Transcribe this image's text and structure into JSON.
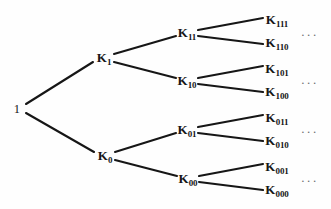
{
  "figure": {
    "name": "binary-branching-tree-diagram",
    "background_color": "#fefefe",
    "edge_color": "#161616",
    "label_color": "#161616",
    "ellipsis_color": "#6f6f6f",
    "width": 331,
    "height": 209
  },
  "nodes": [
    {
      "id": "root",
      "base": "1",
      "sub": "",
      "x": 17,
      "y": 108,
      "level": 0
    },
    {
      "id": "k1",
      "base": "K",
      "sub": "1",
      "x": 104,
      "y": 58,
      "level": 1
    },
    {
      "id": "k0",
      "base": "K",
      "sub": "0",
      "x": 105,
      "y": 156,
      "level": 1
    },
    {
      "id": "k11",
      "base": "K",
      "sub": "11",
      "x": 187,
      "y": 33,
      "level": 2
    },
    {
      "id": "k10",
      "base": "K",
      "sub": "10",
      "x": 187,
      "y": 81,
      "level": 2
    },
    {
      "id": "k01",
      "base": "K",
      "sub": "01",
      "x": 187,
      "y": 130,
      "level": 2
    },
    {
      "id": "k00",
      "base": "K",
      "sub": "00",
      "x": 188,
      "y": 179,
      "level": 2
    },
    {
      "id": "k111",
      "base": "K",
      "sub": "111",
      "x": 277,
      "y": 20,
      "level": 3
    },
    {
      "id": "k110",
      "base": "K",
      "sub": "110",
      "x": 277,
      "y": 43,
      "level": 3
    },
    {
      "id": "k101",
      "base": "K",
      "sub": "101",
      "x": 277,
      "y": 69,
      "level": 3
    },
    {
      "id": "k100",
      "base": "K",
      "sub": "100",
      "x": 277,
      "y": 92,
      "level": 3
    },
    {
      "id": "k011",
      "base": "K",
      "sub": "011",
      "x": 277,
      "y": 118,
      "level": 3
    },
    {
      "id": "k010",
      "base": "K",
      "sub": "010",
      "x": 277,
      "y": 141,
      "level": 3
    },
    {
      "id": "k001",
      "base": "K",
      "sub": "001",
      "x": 277,
      "y": 167,
      "level": 3
    },
    {
      "id": "k000",
      "base": "K",
      "sub": "000",
      "x": 277,
      "y": 190,
      "level": 3
    }
  ],
  "edges": [
    {
      "from": "root",
      "to": "k1",
      "x1": 26,
      "y1": 104,
      "x2": 93,
      "y2": 62
    },
    {
      "from": "root",
      "to": "k0",
      "x1": 26,
      "y1": 113,
      "x2": 94,
      "y2": 152
    },
    {
      "from": "k1",
      "to": "k11",
      "x1": 114,
      "y1": 54,
      "x2": 176,
      "y2": 36
    },
    {
      "from": "k1",
      "to": "k10",
      "x1": 114,
      "y1": 62,
      "x2": 176,
      "y2": 78
    },
    {
      "from": "k0",
      "to": "k01",
      "x1": 115,
      "y1": 152,
      "x2": 176,
      "y2": 133
    },
    {
      "from": "k0",
      "to": "k00",
      "x1": 115,
      "y1": 160,
      "x2": 177,
      "y2": 176
    },
    {
      "from": "k11",
      "to": "k111",
      "x1": 198,
      "y1": 30,
      "x2": 263,
      "y2": 18
    },
    {
      "from": "k11",
      "to": "k110",
      "x1": 198,
      "y1": 36,
      "x2": 263,
      "y2": 44
    },
    {
      "from": "k10",
      "to": "k101",
      "x1": 198,
      "y1": 78,
      "x2": 263,
      "y2": 66
    },
    {
      "from": "k10",
      "to": "k100",
      "x1": 198,
      "y1": 84,
      "x2": 263,
      "y2": 92
    },
    {
      "from": "k01",
      "to": "k011",
      "x1": 198,
      "y1": 127,
      "x2": 263,
      "y2": 115
    },
    {
      "from": "k01",
      "to": "k010",
      "x1": 198,
      "y1": 133,
      "x2": 263,
      "y2": 141
    },
    {
      "from": "k00",
      "to": "k001",
      "x1": 199,
      "y1": 176,
      "x2": 263,
      "y2": 164
    },
    {
      "from": "k00",
      "to": "k000",
      "x1": 199,
      "y1": 182,
      "x2": 263,
      "y2": 190
    }
  ],
  "ellipses": [
    {
      "id": "ellipsis-11",
      "text": "...",
      "x": 310,
      "y": 32
    },
    {
      "id": "ellipsis-10",
      "text": "...",
      "x": 310,
      "y": 80
    },
    {
      "id": "ellipsis-01",
      "text": "...",
      "x": 310,
      "y": 129
    },
    {
      "id": "ellipsis-00",
      "text": "...",
      "x": 310,
      "y": 178
    }
  ]
}
